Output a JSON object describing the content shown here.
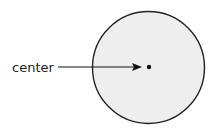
{
  "diagram": {
    "type": "circle-with-labeled-center",
    "label": "center",
    "circle": {
      "cx": 148.5,
      "cy": 67.5,
      "r": 56,
      "fill": "#eeeeee",
      "stroke": "#222222"
    },
    "center_point": {
      "cx": 149,
      "cy": 67,
      "r": 2.2,
      "fill": "#111111"
    },
    "arrow": {
      "x1": 58,
      "y1": 67,
      "x2": 141,
      "y2": 67,
      "color": "#111111"
    }
  }
}
